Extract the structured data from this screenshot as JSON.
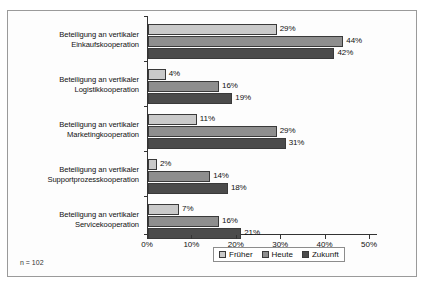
{
  "figure": {
    "footnote": "n = 102",
    "legend_position": "bottom-center",
    "colors": {
      "series_frueher": "#c9c9c9",
      "series_heute": "#8e8e8e",
      "series_zukunft": "#4b4b4b",
      "axis": "#333333",
      "frame_border": "#9a9a9a",
      "background": "#fdfdfd"
    }
  },
  "legend": {
    "items": [
      {
        "label": "Früher",
        "color": "#c9c9c9"
      },
      {
        "label": "Heute",
        "color": "#8e8e8e"
      },
      {
        "label": "Zukunft",
        "color": "#4b4b4b"
      }
    ]
  },
  "x_axis": {
    "ticks": [
      "0%",
      "10%",
      "20%",
      "30%",
      "40%",
      "50%"
    ],
    "min": 0,
    "max": 50
  },
  "categories": [
    {
      "line1": "Beteiligung an vertikaler",
      "line2": "Einkaufskooperation"
    },
    {
      "line1": "Beteiligung an vertikaler",
      "line2": "Logistikkooperation"
    },
    {
      "line1": "Beteiligung an vertikaler",
      "line2": "Marketingkooperation"
    },
    {
      "line1": "Beteiligung an vertikaler",
      "line2": "Supportprozesskooperation"
    },
    {
      "line1": "Beteiligung an vertikaler",
      "line2": "Servicekooperation"
    }
  ],
  "bars": [
    {
      "value": 29,
      "label": "29%",
      "series": 0,
      "group": 0
    },
    {
      "value": 44,
      "label": "44%",
      "series": 1,
      "group": 0
    },
    {
      "value": 42,
      "label": "42%",
      "series": 2,
      "group": 0
    },
    {
      "value": 4,
      "label": "4%",
      "series": 0,
      "group": 1
    },
    {
      "value": 16,
      "label": "16%",
      "series": 1,
      "group": 1
    },
    {
      "value": 19,
      "label": "19%",
      "series": 2,
      "group": 1
    },
    {
      "value": 11,
      "label": "11%",
      "series": 0,
      "group": 2
    },
    {
      "value": 29,
      "label": "29%",
      "series": 1,
      "group": 2
    },
    {
      "value": 31,
      "label": "31%",
      "series": 2,
      "group": 2
    },
    {
      "value": 2,
      "label": "2%",
      "series": 0,
      "group": 3
    },
    {
      "value": 14,
      "label": "14%",
      "series": 1,
      "group": 3
    },
    {
      "value": 18,
      "label": "18%",
      "series": 2,
      "group": 3
    },
    {
      "value": 7,
      "label": "7%",
      "series": 0,
      "group": 4
    },
    {
      "value": 16,
      "label": "16%",
      "series": 1,
      "group": 4
    },
    {
      "value": 21,
      "label": "21%",
      "series": 2,
      "group": 4
    }
  ],
  "chart_data": {
    "type": "bar",
    "orientation": "horizontal",
    "title": "",
    "subtitle": "",
    "xlabel": "",
    "ylabel": "",
    "xlim": [
      0,
      50
    ],
    "xtick_labels": [
      "0%",
      "10%",
      "20%",
      "30%",
      "40%",
      "50%"
    ],
    "xticks": [
      0,
      10,
      20,
      30,
      40,
      50
    ],
    "grid": false,
    "legend": [
      "Früher",
      "Heute",
      "Zukunft"
    ],
    "legend_position": "bottom-center",
    "annotations": [
      "n = 102"
    ],
    "categories": [
      "Beteiligung an vertikaler Einkaufskooperation",
      "Beteiligung an vertikaler Logistikkooperation",
      "Beteiligung an vertikaler Marketingkooperation",
      "Beteiligung an vertikaler Supportprozesskooperation",
      "Beteiligung an vertikaler Servicekooperation"
    ],
    "series": [
      {
        "name": "Früher",
        "color": "#c9c9c9",
        "values": [
          29,
          4,
          11,
          2,
          7
        ],
        "value_labels": [
          "29%",
          "4%",
          "11%",
          "2%",
          "7%"
        ]
      },
      {
        "name": "Heute",
        "color": "#8e8e8e",
        "values": [
          44,
          16,
          29,
          14,
          16
        ],
        "value_labels": [
          "44%",
          "16%",
          "29%",
          "14%",
          "16%"
        ]
      },
      {
        "name": "Zukunft",
        "color": "#4b4b4b",
        "values": [
          42,
          19,
          31,
          18,
          21
        ],
        "value_labels": [
          "42%",
          "19%",
          "31%",
          "18%",
          "21%"
        ]
      }
    ],
    "units": "percent"
  }
}
